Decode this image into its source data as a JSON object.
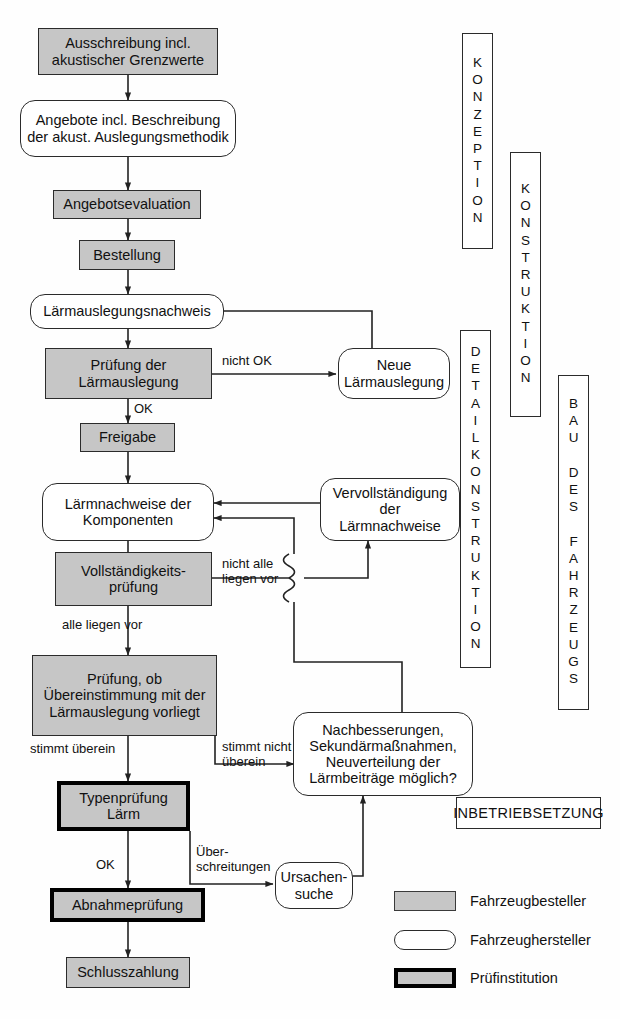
{
  "diagram": {
    "colors": {
      "orderer_fill": "#c6c6c6",
      "maker_fill": "#ffffff",
      "line": "#2b2b2b",
      "institution_border": "#000000"
    }
  },
  "nodes": [
    {
      "id": "ausschreibung",
      "text": "Ausschreibung incl.\nakustischer Grenzwerte"
    },
    {
      "id": "angebote",
      "text": "Angebote incl. Beschreibung\nder akust. Auslegungsmethodik"
    },
    {
      "id": "angebotseval",
      "text": "Angebotsevaluation"
    },
    {
      "id": "bestellung",
      "text": "Bestellung"
    },
    {
      "id": "nachweis",
      "text": "Lärmauslegungsnachweis"
    },
    {
      "id": "pruefung_ausl",
      "text": "Prüfung der\nLärmauslegung"
    },
    {
      "id": "neue_ausl",
      "text": "Neue\nLärmauslegung"
    },
    {
      "id": "freigabe",
      "text": "Freigabe"
    },
    {
      "id": "komponenten",
      "text": "Lärmnachweise der\nKomponenten"
    },
    {
      "id": "vervollstaend",
      "text": "Vervollständigung\nder\nLärmnachweise"
    },
    {
      "id": "vollstaendigkeit",
      "text": "Vollständigkeits-\nprüfung"
    },
    {
      "id": "pruefung_ueber",
      "text": "Prüfung, ob\nÜbereinstimmung mit der\nLärmauslegung vorliegt"
    },
    {
      "id": "nachbesserungen",
      "text": "Nachbesserungen,\nSekundärmaßnahmen,\nNeuverteilung der\nLärmbeiträge möglich?"
    },
    {
      "id": "typenpruefung",
      "text": "Typenprüfung\nLärm"
    },
    {
      "id": "ursachensuche",
      "text": "Ursachen-\nsuche"
    },
    {
      "id": "abnahme",
      "text": "Abnahmeprüfung"
    },
    {
      "id": "schlusszahlung",
      "text": "Schlusszahlung"
    }
  ],
  "edge_labels": [
    {
      "id": "nicht_ok",
      "text": "nicht OK"
    },
    {
      "id": "ok_1",
      "text": "OK"
    },
    {
      "id": "nicht_alle",
      "text": "nicht alle\nliegen vor"
    },
    {
      "id": "alle_liegen",
      "text": "alle liegen vor"
    },
    {
      "id": "stimmt_ueberein",
      "text": "stimmt überein"
    },
    {
      "id": "stimmt_nicht",
      "text": "stimmt nicht\nüberein"
    },
    {
      "id": "ok_2",
      "text": "OK"
    },
    {
      "id": "ueberschreit",
      "text": "Über-\nschreitungen"
    }
  ],
  "phases": [
    {
      "id": "konzeption",
      "text": "KONZEPTION"
    },
    {
      "id": "konstruktion",
      "text": "KONSTRUKTION"
    },
    {
      "id": "detailkonstruktion",
      "text": "DETAILKONSTRUKTION"
    },
    {
      "id": "bau_des_fahrzeugs",
      "text": "BAU DES FAHRZEUGS"
    }
  ],
  "inbetriebsetzung": {
    "text": "INBETRIEBSETZUNG"
  },
  "legend": [
    {
      "id": "fahrzeugbesteller",
      "label": "Fahrzeugbesteller",
      "style": "orderer"
    },
    {
      "id": "fahrzeughersteller",
      "label": "Fahrzeughersteller",
      "style": "maker"
    },
    {
      "id": "pruefinstitution",
      "label": "Prüfinstitution",
      "style": "institution"
    }
  ]
}
